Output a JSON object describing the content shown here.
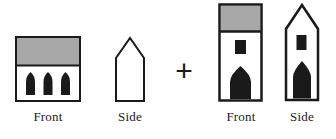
{
  "diagram": {
    "background_color": "#ffffff",
    "stroke_color": "#1a1a1a",
    "fill_dark": "#1a1a1a",
    "fill_roof_gray": "#a8a8a8",
    "fill_wall": "#ffffff",
    "operator": {
      "symbol": "+",
      "name": "plus-operator"
    },
    "groups": [
      {
        "id": "nave",
        "name": "wide-building",
        "views": [
          {
            "id": "nave-front",
            "label": "Front",
            "kind": "front-elevation",
            "outline": "rectangle",
            "roof": {
              "style": "flat-band",
              "color": "#a8a8a8"
            },
            "openings": {
              "count": 3,
              "shape": "pointed-arch",
              "color": "#1a1a1a"
            },
            "window": null
          },
          {
            "id": "nave-side",
            "label": "Side",
            "kind": "side-elevation",
            "outline": "gabled-pentagon",
            "roof": {
              "style": "pitched-outline",
              "color": "#ffffff"
            },
            "openings": {
              "count": 0,
              "shape": "none",
              "color": "#1a1a1a"
            },
            "window": null
          }
        ]
      },
      {
        "id": "tower",
        "name": "tall-tower",
        "views": [
          {
            "id": "tower-front",
            "label": "Front",
            "kind": "front-elevation",
            "outline": "tall-rectangle",
            "roof": {
              "style": "flat-band",
              "color": "#a8a8a8"
            },
            "openings": {
              "count": 1,
              "shape": "pointed-arch",
              "color": "#1a1a1a"
            },
            "window": {
              "shape": "rectangle",
              "color": "#1a1a1a"
            }
          },
          {
            "id": "tower-side",
            "label": "Side",
            "kind": "side-elevation",
            "outline": "tall-gabled-pentagon",
            "roof": {
              "style": "pitched-outline",
              "color": "#ffffff"
            },
            "openings": {
              "count": 1,
              "shape": "pointed-arch",
              "color": "#1a1a1a"
            },
            "window": {
              "shape": "rectangle",
              "color": "#1a1a1a"
            }
          }
        ]
      }
    ]
  }
}
